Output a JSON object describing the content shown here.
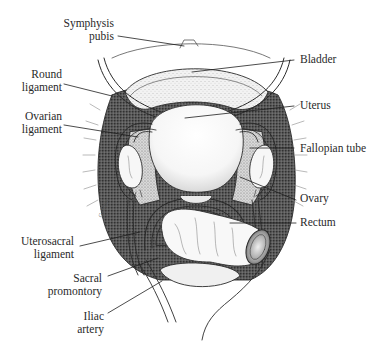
{
  "diagram": {
    "colors": {
      "line": "#2b2b2b",
      "stipple_dark": "#3a3a3a",
      "stipple_light": "#9a9a9a",
      "background": "#ffffff"
    },
    "labels_left": [
      {
        "id": "symphysis-pubis",
        "line1": "Symphysis",
        "line2": "pubis"
      },
      {
        "id": "round-ligament",
        "line1": "Round",
        "line2": "ligament"
      },
      {
        "id": "ovarian-ligament",
        "line1": "Ovarian",
        "line2": "ligament"
      },
      {
        "id": "uterosacral-ligament",
        "line1": "Uterosacral",
        "line2": "ligament"
      },
      {
        "id": "sacral-promontory",
        "line1": "Sacral",
        "line2": "promontory"
      },
      {
        "id": "iliac-artery",
        "line1": "Iliac",
        "line2": "artery"
      }
    ],
    "labels_right": [
      {
        "id": "bladder",
        "text": "Bladder"
      },
      {
        "id": "uterus",
        "text": "Uterus"
      },
      {
        "id": "fallopian-tube",
        "text": "Fallopian tube"
      },
      {
        "id": "ovary",
        "text": "Ovary"
      },
      {
        "id": "rectum",
        "text": "Rectum"
      }
    ],
    "signature": "Gebhart"
  }
}
